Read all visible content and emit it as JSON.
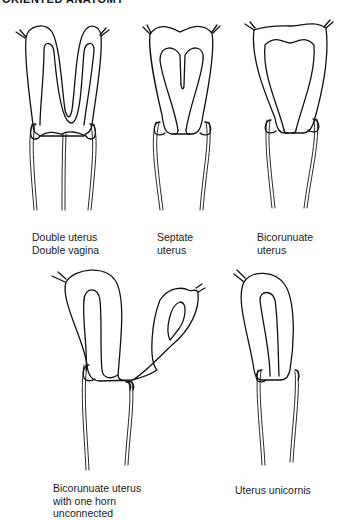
{
  "header": {
    "title": "ORIENTED ANATOMY"
  },
  "figures": [
    {
      "id": "double-uterus",
      "label_lines": [
        "Double uterus",
        "Double vagina"
      ]
    },
    {
      "id": "septate-uterus",
      "label_lines": [
        "Septate",
        "uterus"
      ]
    },
    {
      "id": "bicornuate-uterus",
      "label_lines": [
        "Bicorunuate",
        "uterus"
      ]
    },
    {
      "id": "bicornuate-unconnected",
      "label_lines": [
        "Bicorunuate uterus",
        "with one horn",
        "unconnected"
      ]
    },
    {
      "id": "uterus-unicornis",
      "label_lines": [
        "Uterus unicornis"
      ]
    }
  ]
}
